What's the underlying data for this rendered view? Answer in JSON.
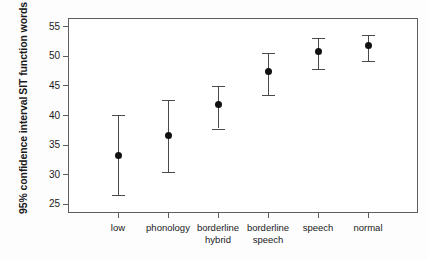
{
  "chart_data": {
    "type": "scatter",
    "title": "",
    "xlabel": "",
    "ylabel": "95% confidence interval SIT function words",
    "ylabel_lines": [
      "95% confidence interval",
      "SIT function words"
    ],
    "grid": false,
    "legend": "none",
    "ylim": [
      23.5,
      56.5
    ],
    "yticks": [
      25,
      30,
      35,
      40,
      45,
      50,
      55
    ],
    "ytick_labels": [
      "25",
      "30",
      "35",
      "40",
      "45",
      "50",
      "55"
    ],
    "categories": [
      "low",
      "phonology",
      "borderline hybrid",
      "borderline speech",
      "speech",
      "normal"
    ],
    "category_labels": [
      [
        "low"
      ],
      [
        "phonology"
      ],
      [
        "borderline",
        "hybrid"
      ],
      [
        "borderline",
        "speech"
      ],
      [
        "speech"
      ],
      [
        "normal"
      ]
    ],
    "values": [
      33.2,
      36.6,
      41.8,
      47.5,
      50.8,
      51.8
    ],
    "ci_lower": [
      26.6,
      30.4,
      37.8,
      43.4,
      47.8,
      49.2
    ],
    "ci_upper": [
      40.1,
      42.7,
      45.0,
      50.5,
      53.2,
      53.7
    ],
    "marker_color": "#111111",
    "errorbar_color": "#4a4a4a",
    "axis_color": "#5d5d5d",
    "background_color": "#ffffff",
    "points": [
      {
        "category": "low",
        "mean": 33.2,
        "lower": 26.6,
        "upper": 40.1
      },
      {
        "category": "phonology",
        "mean": 36.6,
        "lower": 30.4,
        "upper": 42.7
      },
      {
        "category": "borderline hybrid",
        "mean": 41.8,
        "lower": 37.8,
        "upper": 45.0
      },
      {
        "category": "borderline speech",
        "mean": 47.5,
        "lower": 43.4,
        "upper": 50.5
      },
      {
        "category": "speech",
        "mean": 50.8,
        "lower": 47.8,
        "upper": 53.2
      },
      {
        "category": "normal",
        "mean": 51.8,
        "lower": 49.2,
        "upper": 53.7
      }
    ]
  }
}
